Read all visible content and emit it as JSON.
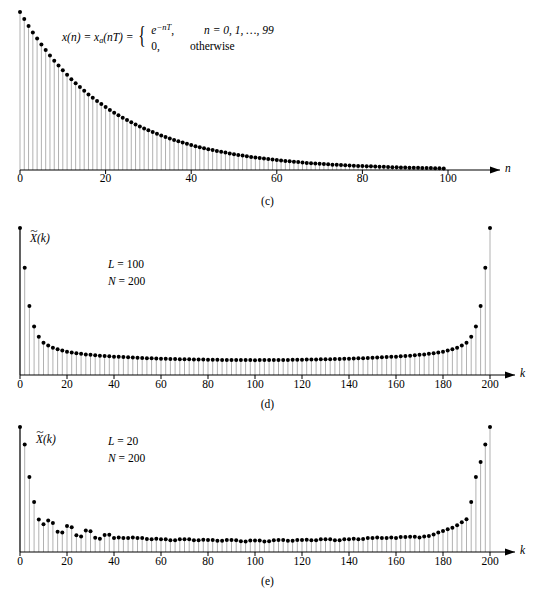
{
  "figure": {
    "panels": [
      {
        "id": "c",
        "caption": "(c)",
        "equation": {
          "lhs": "x(n) = x",
          "lhs_sub": "a",
          "lhs_mid": "(nT) =",
          "case1_value": "e",
          "case1_exp": "−nT",
          "case1_value_tail": ",",
          "case1_cond": "n = 0, 1, …, 99",
          "case2_value": "0,",
          "case2_cond": "otherwise"
        },
        "xaxis": {
          "label": "n",
          "ticks": [
            0,
            20,
            40,
            60,
            80,
            100
          ],
          "tick_labels": [
            "0",
            "20",
            "40",
            "60",
            "80",
            "100"
          ],
          "min": 0,
          "max": 100
        }
      },
      {
        "id": "d",
        "caption": "(d)",
        "ylabel_base": "X",
        "ylabel_tilde": "~",
        "ylabel_arg": "(k)",
        "params": {
          "L_name": "L",
          "L_value": "= 100",
          "N_name": "N",
          "N_value": "= 200"
        },
        "xaxis": {
          "label": "k",
          "ticks": [
            0,
            20,
            40,
            60,
            80,
            100,
            120,
            140,
            160,
            180,
            200
          ],
          "tick_labels": [
            "0",
            "20",
            "40",
            "60",
            "80",
            "100",
            "120",
            "140",
            "160",
            "180",
            "200"
          ],
          "min": 0,
          "max": 200
        }
      },
      {
        "id": "e",
        "caption": "(e)",
        "ylabel_base": "X",
        "ylabel_tilde": "~",
        "ylabel_arg": "(k)",
        "params": {
          "L_name": "L",
          "L_value": "= 20",
          "N_name": "N",
          "N_value": "= 200"
        },
        "xaxis": {
          "label": "k",
          "ticks": [
            0,
            20,
            40,
            60,
            80,
            100,
            120,
            140,
            160,
            180,
            200
          ],
          "tick_labels": [
            "0",
            "20",
            "40",
            "60",
            "80",
            "100",
            "120",
            "140",
            "160",
            "180",
            "200"
          ],
          "min": 0,
          "max": 200
        }
      }
    ]
  },
  "style": {
    "stem_color": "#a8a8a8",
    "marker_color": "#000000",
    "axis_color": "#000000",
    "background": "#ffffff"
  },
  "chart_data": [
    {
      "type": "line",
      "panel": "c",
      "title": "",
      "xlabel": "n",
      "ylabel": "x(n)",
      "xlim": [
        0,
        104
      ],
      "ylim": [
        0,
        1
      ],
      "grid": false,
      "legend": null,
      "annotation": "x(n) = x_a(nT) = e^(-nT) for n = 0,1,...,99; 0 otherwise",
      "series": [
        {
          "name": "x(n) = e^(-nT)",
          "style": "stem",
          "comment": "Decaying exponential, 100 samples, normalized amplitude 1.0 at n=0 with decay constant T such that value at n=99 is near 0.",
          "x": [
            0,
            1,
            2,
            3,
            4,
            5,
            6,
            7,
            8,
            9,
            10,
            11,
            12,
            13,
            14,
            15,
            16,
            17,
            18,
            19,
            20,
            21,
            22,
            23,
            24,
            25,
            26,
            27,
            28,
            29,
            30,
            31,
            32,
            33,
            34,
            35,
            36,
            37,
            38,
            39,
            40,
            41,
            42,
            43,
            44,
            45,
            46,
            47,
            48,
            49,
            50,
            51,
            52,
            53,
            54,
            55,
            56,
            57,
            58,
            59,
            60,
            61,
            62,
            63,
            64,
            65,
            66,
            67,
            68,
            69,
            70,
            71,
            72,
            73,
            74,
            75,
            76,
            77,
            78,
            79,
            80,
            81,
            82,
            83,
            84,
            85,
            86,
            87,
            88,
            89,
            90,
            91,
            92,
            93,
            94,
            95,
            96,
            97,
            98,
            99
          ],
          "values": [
            1.0,
            0.955,
            0.912,
            0.871,
            0.832,
            0.794,
            0.759,
            0.724,
            0.692,
            0.661,
            0.631,
            0.603,
            0.575,
            0.549,
            0.525,
            0.501,
            0.478,
            0.457,
            0.436,
            0.417,
            0.398,
            0.38,
            0.363,
            0.347,
            0.331,
            0.316,
            0.302,
            0.288,
            0.275,
            0.263,
            0.251,
            0.24,
            0.229,
            0.219,
            0.209,
            0.199,
            0.19,
            0.182,
            0.174,
            0.166,
            0.158,
            0.151,
            0.144,
            0.138,
            0.132,
            0.126,
            0.12,
            0.115,
            0.11,
            0.105,
            0.1,
            0.095,
            0.091,
            0.087,
            0.083,
            0.079,
            0.076,
            0.072,
            0.069,
            0.066,
            0.063,
            0.06,
            0.057,
            0.055,
            0.052,
            0.05,
            0.048,
            0.045,
            0.043,
            0.041,
            0.039,
            0.038,
            0.036,
            0.034,
            0.033,
            0.031,
            0.03,
            0.029,
            0.027,
            0.026,
            0.025,
            0.024,
            0.023,
            0.022,
            0.021,
            0.02,
            0.019,
            0.018,
            0.017,
            0.016,
            0.016,
            0.015,
            0.014,
            0.014,
            0.013,
            0.012,
            0.012,
            0.011,
            0.011,
            0.01
          ]
        }
      ]
    },
    {
      "type": "line",
      "panel": "d",
      "title": "",
      "xlabel": "k",
      "ylabel": "X~(k)",
      "xlim": [
        0,
        208
      ],
      "ylim": [
        0,
        1
      ],
      "grid": false,
      "legend": null,
      "annotation": "L = 100, N = 200",
      "parameters": {
        "L": 100,
        "N": 200
      },
      "series": [
        {
          "name": "|X~(k)| magnitude spectrum, L=100 N=200",
          "style": "stem",
          "comment": "Symmetric U-shaped DFT magnitude; peak at k=0 and k=200, minimum near k=100.",
          "x": [
            0,
            2,
            4,
            6,
            8,
            10,
            12,
            14,
            16,
            18,
            20,
            24,
            28,
            32,
            36,
            40,
            50,
            60,
            70,
            80,
            90,
            100,
            110,
            120,
            130,
            140,
            150,
            160,
            164,
            168,
            172,
            176,
            180,
            182,
            184,
            186,
            188,
            190,
            192,
            194,
            196,
            198,
            200
          ],
          "values": [
            1.0,
            0.73,
            0.47,
            0.33,
            0.26,
            0.22,
            0.2,
            0.185,
            0.175,
            0.166,
            0.158,
            0.148,
            0.14,
            0.134,
            0.129,
            0.125,
            0.117,
            0.111,
            0.107,
            0.104,
            0.102,
            0.101,
            0.102,
            0.104,
            0.107,
            0.111,
            0.117,
            0.125,
            0.129,
            0.134,
            0.14,
            0.148,
            0.158,
            0.166,
            0.175,
            0.185,
            0.2,
            0.22,
            0.26,
            0.33,
            0.47,
            0.73,
            1.0
          ]
        }
      ]
    },
    {
      "type": "line",
      "panel": "e",
      "title": "",
      "xlabel": "k",
      "ylabel": "X~(k)",
      "xlim": [
        0,
        208
      ],
      "ylim": [
        0,
        1
      ],
      "grid": false,
      "legend": null,
      "annotation": "L = 20, N = 200",
      "parameters": {
        "L": 20,
        "N": 200
      },
      "series": [
        {
          "name": "|X~(k)| magnitude spectrum, L=20 N=200",
          "style": "stem",
          "comment": "Main lobe at k=0 and k=200 with decaying sidelobe ripples of period ~10 samples across the band.",
          "x": [
            0,
            2,
            4,
            6,
            8,
            10,
            12,
            14,
            16,
            18,
            20,
            22,
            24,
            26,
            28,
            30,
            32,
            34,
            36,
            38,
            40,
            45,
            50,
            55,
            60,
            65,
            70,
            75,
            80,
            85,
            90,
            95,
            100,
            105,
            110,
            115,
            120,
            125,
            130,
            135,
            140,
            145,
            150,
            155,
            160,
            165,
            170,
            175,
            180,
            185,
            190,
            192,
            194,
            196,
            198,
            200
          ],
          "values": [
            1.0,
            0.86,
            0.6,
            0.4,
            0.26,
            0.22,
            0.25,
            0.23,
            0.16,
            0.15,
            0.2,
            0.19,
            0.13,
            0.12,
            0.16,
            0.15,
            0.1,
            0.1,
            0.13,
            0.12,
            0.09,
            0.11,
            0.09,
            0.1,
            0.08,
            0.09,
            0.08,
            0.09,
            0.075,
            0.085,
            0.075,
            0.08,
            0.07,
            0.08,
            0.075,
            0.085,
            0.075,
            0.09,
            0.08,
            0.09,
            0.08,
            0.1,
            0.09,
            0.11,
            0.09,
            0.12,
            0.1,
            0.13,
            0.16,
            0.2,
            0.26,
            0.4,
            0.6,
            0.72,
            0.86,
            1.0
          ]
        }
      ]
    }
  ]
}
